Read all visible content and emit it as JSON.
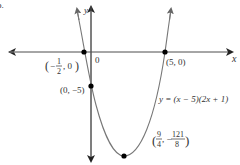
{
  "figure_label": "b.",
  "axes": {
    "x_label": "x",
    "y_label": "y",
    "origin_label": "0"
  },
  "equation": "y = (x − 5)(2x + 1)",
  "points": [
    {
      "name": "x-intercept-left",
      "label_pre": "(−",
      "num": "1",
      "den": "2",
      "label_post": ", 0)",
      "x": -0.5,
      "y": 0
    },
    {
      "name": "x-intercept-right",
      "label": "(5, 0)",
      "x": 5,
      "y": 0
    },
    {
      "name": "y-intercept",
      "label": "(0, −5)",
      "x": 0,
      "y": -5
    },
    {
      "name": "vertex",
      "num1": "9",
      "den1": "4",
      "num2": "121",
      "den2": "8",
      "sep": ", −",
      "x": 2.25,
      "y": -15.125
    }
  ],
  "colors": {
    "axis": "#888888",
    "curve": "#777777",
    "point": "#000000",
    "text": "#333333"
  }
}
